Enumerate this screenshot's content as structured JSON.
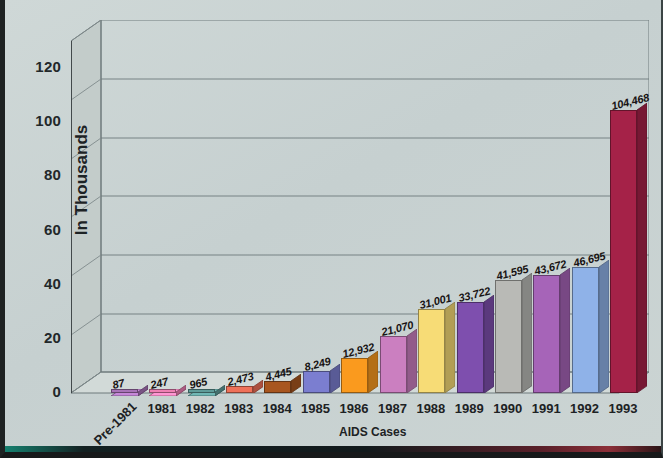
{
  "chart_data": {
    "type": "bar",
    "title": "",
    "xlabel": "AIDS Cases",
    "ylabel": "In Thousands",
    "ylim": [
      0,
      130
    ],
    "ytick_values": [
      0,
      20,
      40,
      60,
      80,
      100,
      120
    ],
    "ytick_labels": [
      "0",
      "20",
      "40",
      "60",
      "80",
      "100",
      "120"
    ],
    "grid": true,
    "legend": "none",
    "units_note": "Y axis is in thousands; bar data labels are raw case counts",
    "categories": [
      "Pre-1981",
      "1981",
      "1982",
      "1983",
      "1984",
      "1985",
      "1986",
      "1987",
      "1988",
      "1989",
      "1990",
      "1991",
      "1992",
      "1993"
    ],
    "values": [
      87,
      247,
      965,
      2473,
      4445,
      8249,
      12932,
      21070,
      31001,
      33722,
      41595,
      43672,
      46695,
      104468
    ],
    "value_labels": [
      "87",
      "247",
      "965",
      "2,473",
      "4,445",
      "8,249",
      "12,932",
      "21,070",
      "31,001",
      "33,722",
      "41,595",
      "43,672",
      "46,695",
      "104,468"
    ],
    "bar_colors": [
      "#a873b8",
      "#ef7fb4",
      "#5e9b99",
      "#ef7159",
      "#a8561f",
      "#7b7ed0",
      "#fa9a1e",
      "#cb7fc0",
      "#f7dc76",
      "#7e4fae",
      "#b9bab6",
      "#a664b8",
      "#8fb2e8",
      "#a52248"
    ]
  },
  "axes": {
    "y_title": "In Thousands",
    "x_title": "AIDS Cases"
  },
  "colors": {
    "background": "#c9d3d3",
    "plot_face": "#c9d2d1",
    "grid": "#6f7b7c",
    "axis": "#31393a",
    "text": "#1d2224"
  }
}
